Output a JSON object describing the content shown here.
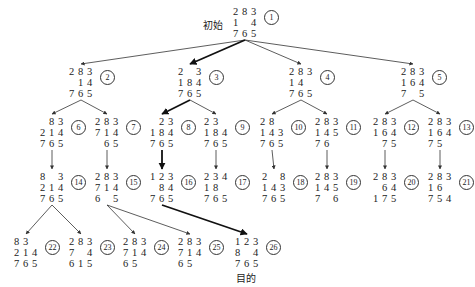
{
  "labels": {
    "start": "初始",
    "goal": "目的"
  },
  "colors": {
    "line": "#333333",
    "bold_line": "#111111",
    "text": "#222222"
  },
  "nodes": [
    {
      "id": 1,
      "x": 233,
      "y": 6,
      "board": [
        [
          "2",
          "8",
          "3"
        ],
        [
          "1",
          "",
          "4"
        ],
        [
          "7",
          "6",
          "5"
        ]
      ]
    },
    {
      "id": 2,
      "x": 69,
      "y": 66,
      "board": [
        [
          "2",
          "8",
          "3"
        ],
        [
          "",
          "1",
          "4"
        ],
        [
          "7",
          "6",
          "5"
        ]
      ]
    },
    {
      "id": 3,
      "x": 178,
      "y": 66,
      "board": [
        [
          "2",
          "",
          "3"
        ],
        [
          "1",
          "8",
          "4"
        ],
        [
          "7",
          "6",
          "5"
        ]
      ]
    },
    {
      "id": 4,
      "x": 289,
      "y": 66,
      "board": [
        [
          "2",
          "8",
          "3"
        ],
        [
          "1",
          "4",
          ""
        ],
        [
          "7",
          "6",
          "5"
        ]
      ]
    },
    {
      "id": 5,
      "x": 401,
      "y": 66,
      "board": [
        [
          "2",
          "8",
          "3"
        ],
        [
          "1",
          "6",
          "4"
        ],
        [
          "7",
          "",
          "5"
        ]
      ]
    },
    {
      "id": 6,
      "x": 40,
      "y": 116,
      "board": [
        [
          "",
          "8",
          "3"
        ],
        [
          "2",
          "1",
          "4"
        ],
        [
          "7",
          "6",
          "5"
        ]
      ]
    },
    {
      "id": 7,
      "x": 95,
      "y": 116,
      "board": [
        [
          "2",
          "8",
          "3"
        ],
        [
          "7",
          "1",
          "4"
        ],
        [
          "",
          "6",
          "5"
        ]
      ]
    },
    {
      "id": 8,
      "x": 150,
      "y": 116,
      "board": [
        [
          "",
          "2",
          "3"
        ],
        [
          "1",
          "8",
          "4"
        ],
        [
          "7",
          "6",
          "5"
        ]
      ]
    },
    {
      "id": 9,
      "x": 204,
      "y": 116,
      "board": [
        [
          "2",
          "3",
          ""
        ],
        [
          "1",
          "8",
          "4"
        ],
        [
          "7",
          "6",
          "5"
        ]
      ]
    },
    {
      "id": 10,
      "x": 260,
      "y": 116,
      "board": [
        [
          "2",
          "8",
          ""
        ],
        [
          "1",
          "4",
          "3"
        ],
        [
          "7",
          "6",
          "5"
        ]
      ]
    },
    {
      "id": 11,
      "x": 315,
      "y": 116,
      "board": [
        [
          "2",
          "8",
          "3"
        ],
        [
          "1",
          "4",
          "5"
        ],
        [
          "7",
          "6",
          ""
        ]
      ]
    },
    {
      "id": 12,
      "x": 373,
      "y": 116,
      "board": [
        [
          "2",
          "8",
          "3"
        ],
        [
          "1",
          "6",
          "4"
        ],
        [
          "",
          "7",
          "5"
        ]
      ]
    },
    {
      "id": 13,
      "x": 428,
      "y": 116,
      "board": [
        [
          "2",
          "8",
          "3"
        ],
        [
          "1",
          "6",
          "4"
        ],
        [
          "7",
          "5",
          ""
        ]
      ]
    },
    {
      "id": 14,
      "x": 40,
      "y": 171,
      "board": [
        [
          "8",
          "",
          "3"
        ],
        [
          "2",
          "1",
          "4"
        ],
        [
          "7",
          "6",
          "5"
        ]
      ]
    },
    {
      "id": 15,
      "x": 95,
      "y": 171,
      "board": [
        [
          "2",
          "8",
          "3"
        ],
        [
          "7",
          "1",
          "4"
        ],
        [
          "6",
          "",
          "5"
        ]
      ]
    },
    {
      "id": 16,
      "x": 150,
      "y": 171,
      "board": [
        [
          "1",
          "2",
          "3"
        ],
        [
          "",
          "8",
          "4"
        ],
        [
          "7",
          "6",
          "5"
        ]
      ]
    },
    {
      "id": 17,
      "x": 204,
      "y": 171,
      "board": [
        [
          "2",
          "3",
          "4"
        ],
        [
          "1",
          "8",
          ""
        ],
        [
          "7",
          "6",
          "5"
        ]
      ]
    },
    {
      "id": 18,
      "x": 262,
      "y": 171,
      "board": [
        [
          "2",
          "",
          "8"
        ],
        [
          "1",
          "4",
          "3"
        ],
        [
          "7",
          "6",
          "5"
        ]
      ]
    },
    {
      "id": 19,
      "x": 315,
      "y": 171,
      "board": [
        [
          "2",
          "8",
          "3"
        ],
        [
          "1",
          "4",
          "5"
        ],
        [
          "7",
          "",
          "6"
        ]
      ]
    },
    {
      "id": 20,
      "x": 373,
      "y": 171,
      "board": [
        [
          "2",
          "8",
          "3"
        ],
        [
          "",
          "6",
          "4"
        ],
        [
          "1",
          "7",
          "5"
        ]
      ]
    },
    {
      "id": 21,
      "x": 428,
      "y": 171,
      "board": [
        [
          "2",
          "8",
          "3"
        ],
        [
          "1",
          "6",
          ""
        ],
        [
          "7",
          "5",
          "4"
        ]
      ]
    },
    {
      "id": 22,
      "x": 14,
      "y": 236,
      "board": [
        [
          "8",
          "3",
          ""
        ],
        [
          "2",
          "1",
          "4"
        ],
        [
          "7",
          "6",
          "5"
        ]
      ]
    },
    {
      "id": 23,
      "x": 69,
      "y": 236,
      "board": [
        [
          "2",
          "8",
          "3"
        ],
        [
          "7",
          "",
          "4"
        ],
        [
          "6",
          "1",
          "5"
        ]
      ]
    },
    {
      "id": 24,
      "x": 123,
      "y": 236,
      "board": [
        [
          "2",
          "8",
          "3"
        ],
        [
          "7",
          "1",
          "4"
        ],
        [
          "6",
          "5",
          ""
        ]
      ]
    },
    {
      "id": 25,
      "x": 178,
      "y": 236,
      "board": [
        [
          "2",
          "8",
          "3"
        ],
        [
          "7",
          "1",
          "4"
        ],
        [
          "6",
          "5",
          ""
        ]
      ]
    },
    {
      "id": 26,
      "x": 235,
      "y": 236,
      "board": [
        [
          "1",
          "2",
          "3"
        ],
        [
          "8",
          "",
          "4"
        ],
        [
          "7",
          "6",
          "5"
        ]
      ]
    }
  ],
  "edges": [
    {
      "from": 1,
      "to": 2,
      "bold": false
    },
    {
      "from": 1,
      "to": 3,
      "bold": true
    },
    {
      "from": 1,
      "to": 4,
      "bold": false
    },
    {
      "from": 1,
      "to": 5,
      "bold": false
    },
    {
      "from": 2,
      "to": 6,
      "bold": false
    },
    {
      "from": 2,
      "to": 7,
      "bold": false
    },
    {
      "from": 3,
      "to": 8,
      "bold": true
    },
    {
      "from": 3,
      "to": 9,
      "bold": false
    },
    {
      "from": 4,
      "to": 10,
      "bold": false
    },
    {
      "from": 4,
      "to": 11,
      "bold": false
    },
    {
      "from": 5,
      "to": 12,
      "bold": false
    },
    {
      "from": 5,
      "to": 13,
      "bold": false
    },
    {
      "from": 6,
      "to": 14,
      "bold": false
    },
    {
      "from": 7,
      "to": 15,
      "bold": false
    },
    {
      "from": 8,
      "to": 16,
      "bold": true
    },
    {
      "from": 9,
      "to": 17,
      "bold": false
    },
    {
      "from": 10,
      "to": 18,
      "bold": false
    },
    {
      "from": 11,
      "to": 19,
      "bold": false
    },
    {
      "from": 12,
      "to": 20,
      "bold": false
    },
    {
      "from": 13,
      "to": 21,
      "bold": false
    },
    {
      "from": 14,
      "to": 22,
      "bold": false
    },
    {
      "from": 14,
      "to": 23,
      "bold": false
    },
    {
      "from": 15,
      "to": 24,
      "bold": false
    },
    {
      "from": 15,
      "to": 25,
      "bold": false
    },
    {
      "from": 16,
      "to": 26,
      "bold": true
    }
  ]
}
